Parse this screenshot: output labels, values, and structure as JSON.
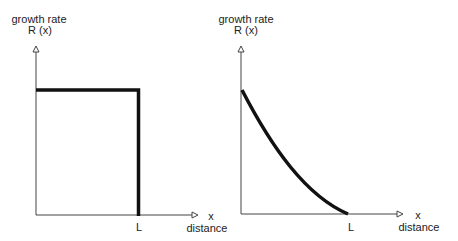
{
  "panels": [
    {
      "id": "step",
      "y_label_line1": "growth rate",
      "y_label_line2": "R (x)",
      "x_label_symbol": "x",
      "x_label_text": "distance",
      "x_tick_label": "L",
      "curve_type": "step",
      "description": "Constant growth rate from 0 to L, dropping to zero at L"
    },
    {
      "id": "decreasing",
      "y_label_line1": "growth rate",
      "y_label_line2": "R (x)",
      "x_label_symbol": "x",
      "x_label_text": "distance",
      "x_tick_label": "L",
      "curve_type": "convex-decreasing",
      "description": "Growth rate decreasing convexly from maximum at 0 to zero at L"
    }
  ],
  "colors": {
    "curve": "#111111",
    "axis": "#444444",
    "text": "#222222",
    "background": "#ffffff"
  }
}
